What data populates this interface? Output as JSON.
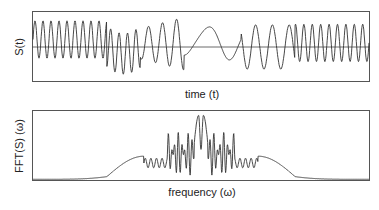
{
  "chart_data": [
    {
      "type": "line",
      "title": "",
      "xlabel": "time (t)",
      "ylabel": "S(t)",
      "grid": false,
      "legend": null,
      "zero_line": true,
      "description": "Time-domain signal oscillating around zero; fast oscillations at left, slower wavy section in the middle, fast oscillations again at right (chirp-like symmetric structure).",
      "x_range": [
        0,
        1
      ],
      "y_range": [
        -1,
        1
      ],
      "segments": [
        {
          "t_start": 0.0,
          "t_end": 0.22,
          "behavior": "high-frequency oscillation, ~9 cycles, positive bias, amplitude ~0.6"
        },
        {
          "t_start": 0.22,
          "t_end": 0.32,
          "behavior": "high-frequency oscillation, ~4 cycles, negative swing to ~-0.8"
        },
        {
          "t_start": 0.32,
          "t_end": 0.45,
          "behavior": "medium-frequency oscillation, growing, peak ~0.85"
        },
        {
          "t_start": 0.45,
          "t_end": 0.62,
          "behavior": "slow waves, dip to ~-0.55, plateau ~0.2, peak ~0.65"
        },
        {
          "t_start": 0.62,
          "t_end": 0.78,
          "behavior": "medium-frequency oscillation, peaks ~0.7, troughs to ~-0.75"
        },
        {
          "t_start": 0.78,
          "t_end": 1.0,
          "behavior": "high-frequency oscillation, ~5 cycles, peaks ~0.7"
        }
      ]
    },
    {
      "type": "line",
      "title": "",
      "xlabel": "frequency (ω)",
      "ylabel": "FFT(S) (ω)",
      "grid": false,
      "legend": null,
      "description": "Symmetric magnitude spectrum: near-zero tails at both ends, smooth bumps at ~0.33 and ~0.67, dense noisy band in between, and two tall central peaks near the middle.",
      "x_range": [
        0,
        1
      ],
      "y_range": [
        0,
        1
      ],
      "features": [
        {
          "omega": 0.0,
          "value": 0.0,
          "note": "flat tail"
        },
        {
          "omega": 0.26,
          "value": 0.05,
          "note": "rise begins"
        },
        {
          "omega": 0.33,
          "value": 0.35,
          "note": "smooth bump"
        },
        {
          "omega": 0.38,
          "value": 0.25,
          "note": "small ripples"
        },
        {
          "omega": 0.45,
          "value": 0.55,
          "note": "noisy band, dips to ~0"
        },
        {
          "omega": 0.49,
          "value": 0.95,
          "note": "main peak 1"
        },
        {
          "omega": 0.5,
          "value": 0.7,
          "note": "middle peak"
        },
        {
          "omega": 0.51,
          "value": 0.95,
          "note": "main peak 2"
        },
        {
          "omega": 0.55,
          "value": 0.55,
          "note": "noisy band, dips to ~0"
        },
        {
          "omega": 0.62,
          "value": 0.25,
          "note": "small ripples"
        },
        {
          "omega": 0.67,
          "value": 0.35,
          "note": "smooth bump"
        },
        {
          "omega": 0.74,
          "value": 0.05,
          "note": "decay"
        },
        {
          "omega": 1.0,
          "value": 0.0,
          "note": "flat tail"
        }
      ]
    }
  ],
  "labels": {
    "top_ylabel": "S(t)",
    "top_xlabel": "time (t)",
    "bottom_ylabel": "FFT(S) (ω)",
    "bottom_xlabel": "frequency (ω)"
  }
}
